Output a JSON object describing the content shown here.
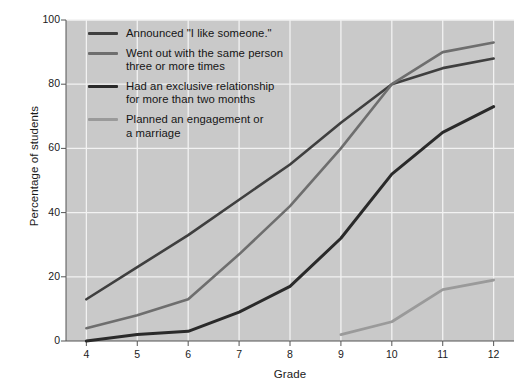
{
  "chart_data": {
    "type": "line",
    "title": "",
    "xlabel": "Grade",
    "ylabel": "Percentage of students",
    "x": [
      4,
      5,
      6,
      7,
      8,
      9,
      10,
      11,
      12
    ],
    "xticks": [
      "4",
      "5",
      "6",
      "7",
      "8",
      "9",
      "10",
      "11",
      "12"
    ],
    "yticks": [
      "0",
      "20",
      "40",
      "60",
      "80",
      "100"
    ],
    "xlim": [
      3.6,
      12.4
    ],
    "ylim": [
      0,
      100
    ],
    "grid": true,
    "grid_color": "#f2f2f2",
    "plot_background": "#c9c9c9",
    "legend_position": "upper-left-inside",
    "series": [
      {
        "name": "Announced \"I like someone.\"",
        "color": "#3f3f3f",
        "width": 2.6,
        "x": [
          4,
          5,
          6,
          7,
          8,
          9,
          10,
          11,
          12
        ],
        "values": [
          13,
          23,
          33,
          44,
          55,
          68,
          80,
          85,
          88
        ]
      },
      {
        "name": "Went out with the same person\nthree or more times",
        "color": "#6e6e6e",
        "width": 2.6,
        "x": [
          4,
          5,
          6,
          7,
          8,
          9,
          10,
          11,
          12
        ],
        "values": [
          4,
          8,
          13,
          27,
          42,
          60,
          80,
          90,
          93
        ]
      },
      {
        "name": "Had an exclusive relationship\nfor more than two months",
        "color": "#2a2a2a",
        "width": 3.0,
        "x": [
          4,
          5,
          6,
          7,
          8,
          9,
          10,
          11,
          12
        ],
        "values": [
          0,
          2,
          3,
          9,
          17,
          32,
          52,
          65,
          73
        ]
      },
      {
        "name": "Planned an engagement or\na marriage",
        "color": "#9a9a9a",
        "width": 2.8,
        "x": [
          9,
          10,
          11,
          12
        ],
        "values": [
          2,
          6,
          16,
          19
        ]
      }
    ]
  },
  "axis": {
    "x_title": "Grade",
    "y_title": "Percentage of students"
  },
  "legend": {
    "items": [
      {
        "label": "Announced \"I like someone.\"",
        "color": "#3f3f3f",
        "thickness": "3px"
      },
      {
        "label": "Went out with the same person\nthree or more times",
        "color": "#6e6e6e",
        "thickness": "3px"
      },
      {
        "label": "Had an exclusive relationship\nfor more than two months",
        "color": "#2a2a2a",
        "thickness": "3.6px"
      },
      {
        "label": "Planned an engagement or\na marriage",
        "color": "#9a9a9a",
        "thickness": "3px"
      }
    ]
  }
}
